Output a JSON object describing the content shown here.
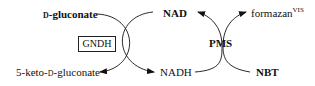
{
  "diagram": {
    "type": "coupled enzymatic reaction scheme",
    "enzyme": {
      "label": "GNDH",
      "boxed": true
    },
    "substrate": {
      "prefix": "d",
      "name": "-gluconate"
    },
    "product": {
      "prefix_a": "5-keto-",
      "prefix_d": "d",
      "name": "-gluconate"
    },
    "cofactor_oxidized": "NAD",
    "cofactor_reduced": "NADH",
    "mediator": "PMS",
    "dye_reactant": "NBT",
    "dye_product": {
      "name": "formazan",
      "superscript": "VIS"
    },
    "edges": [
      {
        "from": "d-gluconate",
        "to": "5-keto-d-gluconate",
        "via": "GNDH"
      },
      {
        "from": "NAD",
        "to": "NADH",
        "via": "GNDH"
      },
      {
        "from": "NADH",
        "to": "NAD",
        "via": "PMS"
      },
      {
        "from": "NBT",
        "to": "formazan",
        "via": "PMS"
      }
    ],
    "colors": {
      "ink": "#111111",
      "background": "#ffffff"
    }
  }
}
